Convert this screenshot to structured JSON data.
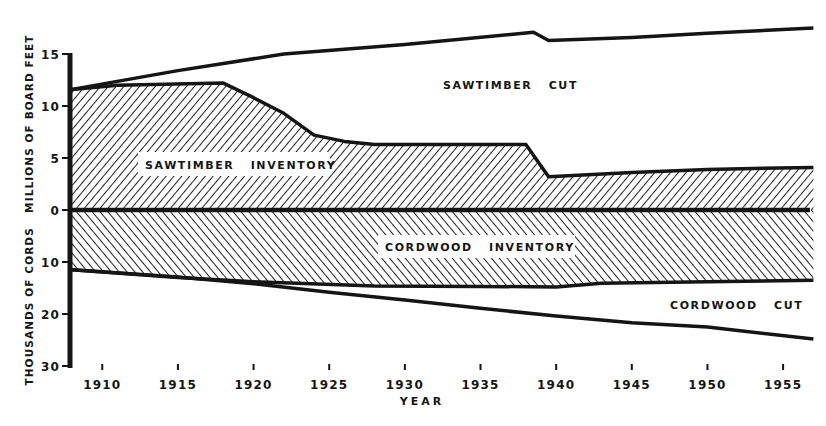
{
  "chart_data": {
    "type": "area",
    "title": "",
    "xlabel": "YEAR",
    "ylabel": "THOUSANDS OF CORDS   MILLIONS OF BOARD FEET",
    "ylabel_upper": "MILLIONS OF BOARD FEET",
    "ylabel_lower": "THOUSANDS OF CORDS",
    "xlim": [
      1908,
      1957
    ],
    "ylim_upper": [
      0,
      15
    ],
    "ylim_lower": [
      0,
      30
    ],
    "grid": false,
    "legend": "inline labels",
    "x_ticks": [
      1910,
      1915,
      1920,
      1925,
      1930,
      1935,
      1940,
      1945,
      1950,
      1955
    ],
    "x_tick_labels": [
      "1910",
      "1915",
      "1920",
      "1925",
      "1930",
      "1935",
      "1940",
      "1945",
      "1950",
      "1955"
    ],
    "y_ticks_upper": [
      15,
      10,
      5,
      0
    ],
    "y_ticks_lower": [
      10,
      20,
      30
    ],
    "y_tick_labels": [
      "15",
      "10",
      "5",
      "0",
      "10",
      "20",
      "30"
    ],
    "series": [
      {
        "name": "SAWTIMBER INVENTORY",
        "unit": "millions of board feet",
        "fill": "diagonal hatch (/)",
        "x": [
          1908,
          1911,
          1918,
          1920,
          1922,
          1924,
          1926,
          1928,
          1938,
          1939.5,
          1945,
          1950,
          1957
        ],
        "values": [
          11.6,
          12.0,
          12.2,
          10.8,
          9.3,
          7.2,
          6.6,
          6.3,
          6.3,
          3.2,
          3.6,
          3.9,
          4.1
        ]
      },
      {
        "name": "SAWTIMBER CUT",
        "unit": "millions of board feet (cumulative top line)",
        "x": [
          1908,
          1915,
          1922,
          1930,
          1938.5,
          1939.5,
          1945,
          1950,
          1957
        ],
        "values": [
          11.6,
          13.4,
          15.0,
          15.9,
          17.1,
          16.3,
          16.6,
          17.0,
          17.5
        ]
      },
      {
        "name": "CORDWOOD INVENTORY",
        "unit": "thousands of cords",
        "fill": "diagonal hatch (\\)",
        "x": [
          1908,
          1915,
          1920,
          1928,
          1935,
          1940,
          1943,
          1950,
          1957
        ],
        "values": [
          11.5,
          13.0,
          13.8,
          14.6,
          14.7,
          14.8,
          14.1,
          13.8,
          13.5
        ]
      },
      {
        "name": "CORDWOOD CUT",
        "unit": "thousands of cords (cumulative bottom line)",
        "x": [
          1908,
          1915,
          1920,
          1925,
          1930,
          1935,
          1940,
          1945,
          1950,
          1957
        ],
        "values": [
          11.5,
          12.9,
          14.2,
          15.8,
          17.3,
          18.9,
          20.4,
          21.7,
          22.5,
          24.8
        ]
      }
    ],
    "annotations": [
      "SAWTIMBER CUT",
      "SAWTIMBER INVENTORY",
      "CORDWOOD INVENTORY",
      "CORDWOOD CUT"
    ]
  },
  "labels": {
    "sawtimber_cut": "SAWTIMBER   CUT",
    "sawtimber_inventory": "SAWTIMBER   INVENTORY",
    "cordwood_inventory": "CORDWOOD   INVENTORY",
    "cordwood_cut": "CORDWOOD   CUT",
    "xlabel": "YEAR",
    "ylabel": "THOUSANDS OF CORDS   MILLIONS OF BOARD FEET"
  },
  "colors": {
    "ink": "#151515",
    "background": "#ffffff"
  }
}
